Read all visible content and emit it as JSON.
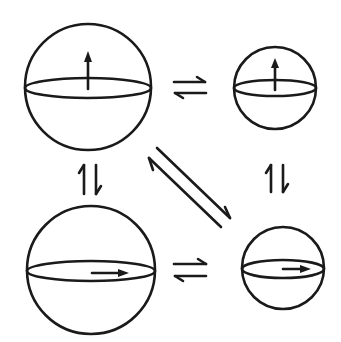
{
  "diagram": {
    "stroke_color": "#1a1a1a",
    "background": "#ffffff",
    "nodes": [
      {
        "id": "large-vertical",
        "size": "large",
        "arrow_direction": "up",
        "cx": 88,
        "cy": 87,
        "r": 63
      },
      {
        "id": "small-vertical",
        "size": "small",
        "arrow_direction": "up",
        "cx": 275,
        "cy": 88,
        "r": 41
      },
      {
        "id": "large-horizontal",
        "size": "large",
        "arrow_direction": "right",
        "cx": 91,
        "cy": 270,
        "r": 64
      },
      {
        "id": "small-horizontal",
        "size": "small",
        "arrow_direction": "right",
        "cx": 283,
        "cy": 268,
        "r": 41
      }
    ],
    "equilibria": [
      {
        "from": "large-vertical",
        "to": "small-vertical",
        "symbol": "⇌",
        "orientation": "horizontal"
      },
      {
        "from": "large-horizontal",
        "to": "small-horizontal",
        "symbol": "⇌",
        "orientation": "horizontal"
      },
      {
        "from": "large-vertical",
        "to": "large-horizontal",
        "symbol": "⥮",
        "orientation": "vertical"
      },
      {
        "from": "small-vertical",
        "to": "small-horizontal",
        "symbol": "⥮",
        "orientation": "vertical"
      },
      {
        "from": "large-vertical",
        "to": "small-horizontal",
        "symbol": "⇌",
        "orientation": "diagonal"
      }
    ]
  }
}
